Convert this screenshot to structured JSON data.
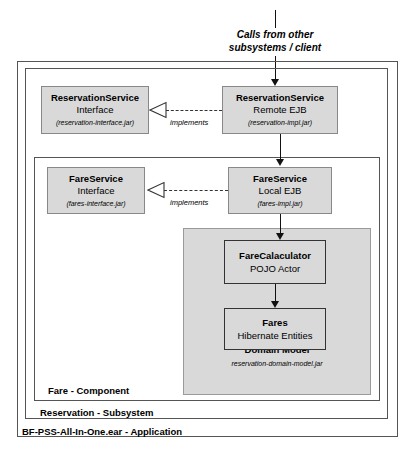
{
  "diagram": {
    "title_caption": {
      "line1": "Calls from other",
      "line2": "subsystems / client"
    },
    "frames": [
      {
        "name": "application",
        "label": "BF-PSS-All-In-One.ear - Application"
      },
      {
        "name": "subsystem",
        "label": "Reservation - Subsystem"
      },
      {
        "name": "component",
        "label": "Fare - Component"
      }
    ],
    "nodes": {
      "reservation_service_interface": {
        "title": "ReservationService",
        "subtitle": "Interface",
        "artifact": "(reservation-interface.jar)"
      },
      "reservation_service_remote_ejb": {
        "title": "ReservationService",
        "subtitle": "Remote EJB",
        "artifact": "(reservation-impl.jar)"
      },
      "fare_service_interface": {
        "title": "FareService",
        "subtitle": "Interface",
        "artifact": "(fares-interface.jar)"
      },
      "fare_service_local_ejb": {
        "title": "FareService",
        "subtitle": "Local EJB",
        "artifact": "(fares-impl.jar)"
      },
      "fare_calculator": {
        "title": "FareCalaculator",
        "subtitle": "POJO Actor"
      },
      "fares_entities": {
        "title": "Fares",
        "subtitle": "Hibernate Entities"
      },
      "domain_model": {
        "title": "Domain Model",
        "artifact": "reservation-domain-model.jar"
      }
    },
    "edges": {
      "implements_reservation": "implements",
      "implements_fare": "implements"
    },
    "colors": {
      "box_fill": "#d9d9d9",
      "box_border": "#888888",
      "frame_border": "#555555",
      "connector": "#111111",
      "page_background": "#ffffff"
    }
  }
}
